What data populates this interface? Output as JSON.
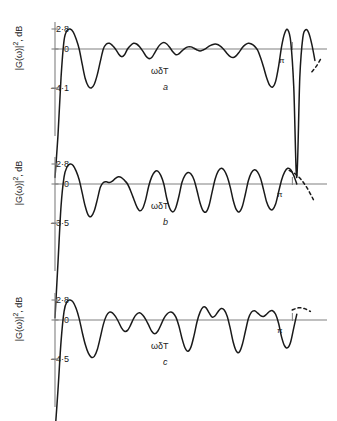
{
  "figure": {
    "background": "#ffffff",
    "trace_color": "#1a1a1a",
    "axis_color": "#808080"
  },
  "chart_data": [
    {
      "type": "line",
      "id": "a",
      "title": "",
      "panel_letter": "a",
      "xlabel": "ωδT",
      "ylabel": "|G(ω)|², dB",
      "ytick_labels": [
        "2·8",
        "0",
        "–4·1"
      ],
      "ytick_values": [
        2.8,
        0,
        -4.1
      ],
      "ylim": [
        -4.1,
        2.8
      ],
      "xlim": [
        0,
        3.6
      ],
      "annotations": [
        {
          "text": "π",
          "x": 3.1416
        }
      ],
      "grid": false,
      "legend": null,
      "dashed_tail": true,
      "x": [
        0.0,
        0.04,
        0.08,
        0.12,
        0.16,
        0.2,
        0.24,
        0.28,
        0.32,
        0.36,
        0.4,
        0.44,
        0.48,
        0.52,
        0.56,
        0.6,
        0.64,
        0.68,
        0.72,
        0.76,
        0.8,
        0.84,
        0.88,
        0.92,
        0.96,
        1.0,
        1.04,
        1.08,
        1.12,
        1.16,
        1.2,
        1.24,
        1.28,
        1.32,
        1.36,
        1.4,
        1.44,
        1.48,
        1.52,
        1.56,
        1.6,
        1.64,
        1.68,
        1.72,
        1.76,
        1.8,
        1.84,
        1.88,
        1.92,
        1.96,
        2.0,
        2.04,
        2.08,
        2.12,
        2.16,
        2.2,
        2.24,
        2.28,
        2.32,
        2.36,
        2.4,
        2.44,
        2.48,
        2.52,
        2.56,
        2.6,
        2.64,
        2.68,
        2.72,
        2.76,
        2.8,
        2.84,
        2.88,
        2.92,
        2.96,
        3.0,
        3.04,
        3.08,
        3.12,
        3.16,
        3.2,
        3.24,
        3.28,
        3.32,
        3.36,
        3.4,
        3.44
      ],
      "values": [
        -13.5,
        -9.0,
        -3.0,
        1.2,
        2.6,
        2.8,
        2.4,
        1.4,
        0.0,
        -1.6,
        -3.1,
        -3.9,
        -4.1,
        -3.7,
        -2.7,
        -1.3,
        0.0,
        0.7,
        0.8,
        0.5,
        0.0,
        -0.5,
        -0.8,
        -0.6,
        0.0,
        0.5,
        0.8,
        0.7,
        0.3,
        -0.2,
        -0.7,
        -1.0,
        -0.9,
        -0.4,
        0.2,
        0.7,
        0.9,
        0.7,
        0.2,
        -0.3,
        -0.6,
        -0.5,
        -0.2,
        0.1,
        0.3,
        0.3,
        0.1,
        -0.1,
        -0.2,
        -0.1,
        0.1,
        0.4,
        0.6,
        0.7,
        0.6,
        0.3,
        -0.1,
        -0.5,
        -0.8,
        -0.9,
        -0.7,
        -0.3,
        0.2,
        0.6,
        0.8,
        0.7,
        0.4,
        -0.1,
        -0.9,
        -1.9,
        -3.0,
        -3.8,
        -4.0,
        -3.4,
        -1.8,
        0.4,
        2.2,
        2.7,
        1.0,
        -4.0,
        -13.5,
        -3.0,
        1.6,
        2.7,
        2.2,
        0.6,
        -1.2,
        -2.4
      ],
      "tail_x": [
        3.4,
        3.46,
        3.52
      ],
      "tail_values": [
        -2.4,
        -1.8,
        -1.0
      ]
    },
    {
      "type": "line",
      "id": "b",
      "title": "",
      "panel_letter": "b",
      "xlabel": "ωδT",
      "ylabel": "|G(ω)|², dB",
      "ytick_labels": [
        "2·8",
        "0",
        "–3·5"
      ],
      "ytick_values": [
        2.8,
        0,
        -3.5
      ],
      "ylim": [
        -3.5,
        2.8
      ],
      "xlim": [
        0,
        3.6
      ],
      "annotations": [
        {
          "text": "π",
          "x": 3.1416
        }
      ],
      "grid": false,
      "legend": null,
      "dashed_tail": true,
      "x": [
        0.0,
        0.04,
        0.08,
        0.12,
        0.16,
        0.2,
        0.24,
        0.28,
        0.32,
        0.36,
        0.4,
        0.44,
        0.48,
        0.52,
        0.56,
        0.6,
        0.64,
        0.68,
        0.72,
        0.76,
        0.8,
        0.84,
        0.88,
        0.92,
        0.96,
        1.0,
        1.04,
        1.08,
        1.12,
        1.16,
        1.2,
        1.24,
        1.28,
        1.32,
        1.36,
        1.4,
        1.44,
        1.48,
        1.52,
        1.56,
        1.6,
        1.64,
        1.68,
        1.72,
        1.76,
        1.8,
        1.84,
        1.88,
        1.92,
        1.96,
        2.0,
        2.04,
        2.08,
        2.12,
        2.16,
        2.2,
        2.24,
        2.28,
        2.32,
        2.36,
        2.4,
        2.44,
        2.48,
        2.52,
        2.56,
        2.6,
        2.64,
        2.68,
        2.72,
        2.76,
        2.8,
        2.84,
        2.88,
        2.92,
        2.96,
        3.0,
        3.04,
        3.08,
        3.12,
        3.16,
        3.2
      ],
      "values": [
        -12.0,
        -7.0,
        -2.0,
        1.0,
        2.4,
        2.8,
        2.6,
        1.8,
        0.6,
        -0.8,
        -2.0,
        -2.8,
        -2.9,
        -2.4,
        -1.4,
        -0.3,
        0.2,
        0.3,
        0.2,
        0.4,
        0.8,
        1.0,
        0.9,
        0.5,
        0.0,
        -0.6,
        -1.3,
        -2.0,
        -2.4,
        -2.2,
        -1.4,
        -0.2,
        1.0,
        1.7,
        1.8,
        1.2,
        0.0,
        -1.3,
        -2.2,
        -2.5,
        -2.1,
        -1.1,
        0.2,
        1.2,
        1.6,
        1.4,
        0.6,
        -0.6,
        -1.7,
        -2.4,
        -2.5,
        -1.9,
        -0.7,
        0.7,
        1.8,
        2.2,
        1.9,
        1.0,
        -0.3,
        -1.5,
        -2.3,
        -2.5,
        -2.0,
        -0.9,
        0.5,
        1.6,
        2.0,
        1.7,
        0.8,
        -0.5,
        -1.6,
        -2.2,
        -2.3,
        -1.8,
        -0.7,
        0.6,
        1.7,
        2.2,
        2.0,
        1.2,
        0.0
      ],
      "tail_x": [
        3.1,
        3.18,
        3.26,
        3.34,
        3.42
      ],
      "tail_values": [
        1.9,
        1.4,
        0.6,
        -0.4,
        -1.4
      ]
    },
    {
      "type": "line",
      "id": "c",
      "title": "",
      "panel_letter": "c",
      "xlabel": "ωδT",
      "ylabel": "|G(ω)|², dB",
      "ytick_labels": [
        "2·8",
        "0",
        "–4·5"
      ],
      "ytick_values": [
        2.8,
        0,
        -4.5
      ],
      "ylim": [
        -4.5,
        2.8
      ],
      "xlim": [
        0,
        3.6
      ],
      "annotations": [
        {
          "text": "π",
          "x": 3.1416
        }
      ],
      "grid": false,
      "legend": null,
      "dashed_tail": true,
      "x": [
        0.0,
        0.04,
        0.08,
        0.12,
        0.16,
        0.2,
        0.24,
        0.28,
        0.32,
        0.36,
        0.4,
        0.44,
        0.48,
        0.52,
        0.56,
        0.6,
        0.64,
        0.68,
        0.72,
        0.76,
        0.8,
        0.84,
        0.88,
        0.92,
        0.96,
        1.0,
        1.04,
        1.08,
        1.12,
        1.16,
        1.2,
        1.24,
        1.28,
        1.32,
        1.36,
        1.4,
        1.44,
        1.48,
        1.52,
        1.56,
        1.6,
        1.64,
        1.68,
        1.72,
        1.76,
        1.8,
        1.84,
        1.88,
        1.92,
        1.96,
        2.0,
        2.04,
        2.08,
        2.12,
        2.16,
        2.2,
        2.24,
        2.28,
        2.32,
        2.36,
        2.4,
        2.44,
        2.48,
        2.52,
        2.56,
        2.6,
        2.64,
        2.68,
        2.72,
        2.76,
        2.8,
        2.84,
        2.88,
        2.92,
        2.96,
        3.0,
        3.04,
        3.08,
        3.12,
        3.16,
        3.2
      ],
      "values": [
        -13.0,
        -8.0,
        -2.5,
        1.2,
        2.6,
        2.8,
        2.5,
        1.6,
        0.2,
        -1.4,
        -2.8,
        -3.8,
        -4.3,
        -4.2,
        -3.4,
        -2.0,
        -0.5,
        0.6,
        1.1,
        1.0,
        0.5,
        -0.2,
        -0.9,
        -1.3,
        -1.2,
        -0.6,
        0.2,
        0.8,
        1.0,
        0.7,
        0.1,
        -0.6,
        -1.3,
        -1.6,
        -1.3,
        -0.6,
        0.2,
        0.8,
        1.1,
        1.0,
        0.4,
        -0.7,
        -2.1,
        -3.2,
        -3.6,
        -3.1,
        -1.8,
        -0.2,
        1.1,
        1.8,
        1.7,
        1.0,
        0.4,
        0.6,
        1.2,
        1.6,
        1.4,
        0.5,
        -1.0,
        -2.6,
        -3.6,
        -3.7,
        -2.8,
        -1.3,
        0.2,
        1.1,
        1.3,
        1.0,
        0.6,
        0.5,
        0.8,
        1.2,
        1.3,
        0.8,
        -0.4,
        -2.0,
        -3.0,
        -3.2,
        -2.5,
        -0.9,
        0.8
      ],
      "tail_x": [
        3.14,
        3.22,
        3.3,
        3.38
      ],
      "tail_values": [
        1.4,
        1.7,
        1.6,
        1.2
      ]
    }
  ]
}
